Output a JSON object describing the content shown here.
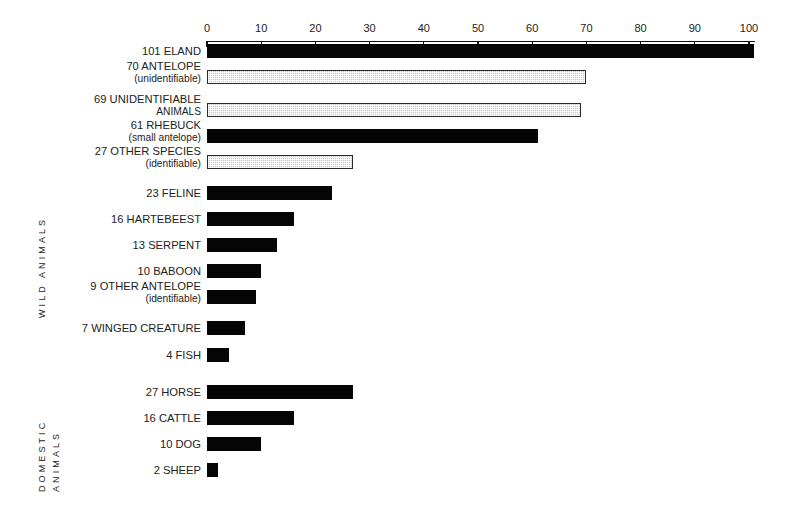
{
  "chart_data": {
    "type": "bar",
    "orientation": "horizontal",
    "title": "",
    "xlabel": "",
    "ylabel": "",
    "xlim": [
      0,
      103
    ],
    "grid": false,
    "legend": null,
    "axis_ticks": [
      0,
      10,
      20,
      30,
      40,
      50,
      60,
      70,
      80,
      90,
      100
    ],
    "groups": [
      {
        "name": "WILD ANIMALS",
        "label_lines": [
          "WILD ANIMALS"
        ],
        "categories": [
          "101 ELAND",
          "70 ANTELOPE (unidentifiable)",
          "69 UNIDENTIFIABLE ANIMALS",
          "61 RHEBUCK (small antelope)",
          "27 OTHER SPECIES (identifiable)",
          "23 FELINE",
          "16 HARTEBEEST",
          "13 SERPENT",
          "10 BABOON",
          "9 OTHER ANTELOPE (identifiable)",
          "7 WINGED CREATURE",
          "4 FISH"
        ],
        "values": [
          101,
          70,
          69,
          61,
          27,
          23,
          16,
          13,
          10,
          9,
          7,
          4
        ],
        "bars": [
          {
            "value": 101,
            "main": "101 ELAND",
            "sub": "",
            "fill": "solid",
            "top": 44
          },
          {
            "value": 70,
            "main": "70 ANTELOPE",
            "sub": "(unidentifiable)",
            "fill": "hatched",
            "top": 70
          },
          {
            "value": 69,
            "main": "69 UNIDENTIFIABLE",
            "sub": "ANIMALS",
            "fill": "hatched",
            "top": 103
          },
          {
            "value": 61,
            "main": "61 RHEBUCK",
            "sub": "(small antelope)",
            "fill": "solid",
            "top": 129
          },
          {
            "value": 27,
            "main": "27 OTHER SPECIES",
            "sub": "(identifiable)",
            "fill": "hatched",
            "top": 155
          },
          {
            "value": 23,
            "main": "23 FELINE",
            "sub": "",
            "fill": "solid",
            "top": 186
          },
          {
            "value": 16,
            "main": "16 HARTEBEEST",
            "sub": "",
            "fill": "solid",
            "top": 212
          },
          {
            "value": 13,
            "main": "13 SERPENT",
            "sub": "",
            "fill": "solid",
            "top": 238
          },
          {
            "value": 10,
            "main": "10 BABOON",
            "sub": "",
            "fill": "solid",
            "top": 264
          },
          {
            "value": 9,
            "main": "9 OTHER ANTELOPE",
            "sub": "(identifiable)",
            "fill": "solid",
            "top": 290
          },
          {
            "value": 7,
            "main": "7 WINGED CREATURE",
            "sub": "",
            "fill": "solid",
            "top": 321
          },
          {
            "value": 4,
            "main": "4 FISH",
            "sub": "",
            "fill": "solid",
            "top": 348
          }
        ]
      },
      {
        "name": "DOMESTIC ANIMALS",
        "label_lines": [
          "DOMESTIC",
          "ANIMALS"
        ],
        "categories": [
          "27 HORSE",
          "16 CATTLE",
          "10 DOG",
          "2 SHEEP"
        ],
        "values": [
          27,
          16,
          10,
          2
        ],
        "bars": [
          {
            "value": 27,
            "main": "27 HORSE",
            "sub": "",
            "fill": "solid",
            "top": 385
          },
          {
            "value": 16,
            "main": "16 CATTLE",
            "sub": "",
            "fill": "solid",
            "top": 411
          },
          {
            "value": 10,
            "main": "10 DOG",
            "sub": "",
            "fill": "solid",
            "top": 437
          },
          {
            "value": 2,
            "main": "2 SHEEP",
            "sub": "",
            "fill": "solid",
            "top": 463
          }
        ]
      }
    ]
  },
  "geometry": {
    "origin_x": 207,
    "px_per_unit": 5.42,
    "label_right_edge": 201,
    "bar_height": 14
  },
  "colors": {
    "solid_fill": "#050505",
    "hatched_fill": "#c9c9c9",
    "hatched_border": "#2a2a2a",
    "axis": "#111111",
    "text": "#222222",
    "background": "#ffffff"
  }
}
